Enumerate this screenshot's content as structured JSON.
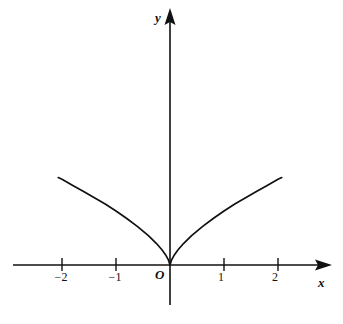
{
  "figure": {
    "background_color": "#ffffff",
    "ink_color": "#111111",
    "width": 343,
    "height": 324
  },
  "axes": {
    "x_axis_label": "x",
    "y_axis_label": "y",
    "origin_label": "O",
    "x_tick_labels": [
      "−2",
      "−1",
      "1",
      "2"
    ],
    "x_tick_values": [
      -2,
      -1,
      1,
      2
    ],
    "y_tick_labels": [],
    "x_arrow": "arrow-right",
    "y_arrow": "arrow-up"
  },
  "chart_data": {
    "type": "line",
    "title": "",
    "subtitle": "",
    "xlabel": "x",
    "ylabel": "y",
    "legend": [],
    "legend_position": "none",
    "grid": false,
    "xlim": [
      -2.9,
      3.0
    ],
    "ylim": [
      -0.75,
      4.75
    ],
    "xticks": [
      -2,
      -1,
      1,
      2
    ],
    "xticklabels": [
      "−2",
      "−1",
      "1",
      "2"
    ],
    "yticks": [],
    "yticklabels": [],
    "annotations": [
      "O"
    ],
    "series": [
      {
        "name": "y = x^(2/3)",
        "equation": "y = ∛(x²)",
        "x": [
          -2.07,
          -2.0,
          -1.8,
          -1.6,
          -1.4,
          -1.2,
          -1.0,
          -0.8,
          -0.6,
          -0.4,
          -0.25,
          -0.15,
          -0.08,
          -0.03,
          0.0,
          0.03,
          0.08,
          0.15,
          0.25,
          0.4,
          0.6,
          0.8,
          1.0,
          1.2,
          1.4,
          1.6,
          1.8,
          2.0,
          2.07
        ],
        "y": [
          1.62,
          1.587,
          1.472,
          1.362,
          1.246,
          1.129,
          1.0,
          0.862,
          0.711,
          0.543,
          0.397,
          0.282,
          0.186,
          0.096,
          0.0,
          0.096,
          0.186,
          0.282,
          0.397,
          0.543,
          0.711,
          0.862,
          1.0,
          1.129,
          1.246,
          1.362,
          1.472,
          1.587,
          1.62
        ]
      }
    ]
  }
}
